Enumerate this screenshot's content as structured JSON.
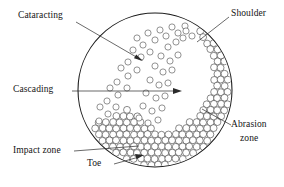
{
  "figure": {
    "shell": {
      "center_x": 155,
      "center_y": 90,
      "radius": 77,
      "stroke_color": "#1a1a1a"
    }
  },
  "labels": {
    "cataracting": "Cataracting",
    "cascading": "Cascading",
    "shoulder": "Shoulder",
    "abrasion_zone_line1": "Abrasion",
    "abrasion_zone_line2": "zone",
    "impact_zone": "Impact zone",
    "toe": "Toe"
  },
  "chart_data": {
    "type": "diagram",
    "annotations": [
      {
        "name": "Cataracting",
        "text_x": 18,
        "text_y": 16,
        "target_x": 142,
        "target_y": 61
      },
      {
        "name": "Cascading",
        "text_x": 14,
        "text_y": 85,
        "target_x": 181,
        "target_y": 91
      },
      {
        "name": "Shoulder",
        "text_x": 232,
        "text_y": 13,
        "target_x": 197,
        "target_y": 42
      },
      {
        "name": "Abrasion zone",
        "text_x": 233,
        "text_y": 124,
        "target_x": 202,
        "target_y": 110
      },
      {
        "name": "Impact zone",
        "text_x": 14,
        "text_y": 150,
        "target_x": 141,
        "target_y": 147
      },
      {
        "name": "Toe",
        "text_x": 86,
        "text_y": 163,
        "target_x": 143,
        "target_y": 156
      }
    ],
    "zones": [
      {
        "name": "abrasion zone",
        "description": "dense close-packed ball bed hugging the right and lower-right inner wall"
      },
      {
        "name": "cataracting stream",
        "description": "sparse scattered balls in flight across the mill interior"
      },
      {
        "name": "cascading stream",
        "description": "balls rolling down the charge surface toward the toe"
      },
      {
        "name": "shoulder",
        "description": "upper departure point of the charge at the right wall"
      },
      {
        "name": "toe",
        "description": "lower impact point of the charge at the lower-left of the bed"
      }
    ]
  }
}
